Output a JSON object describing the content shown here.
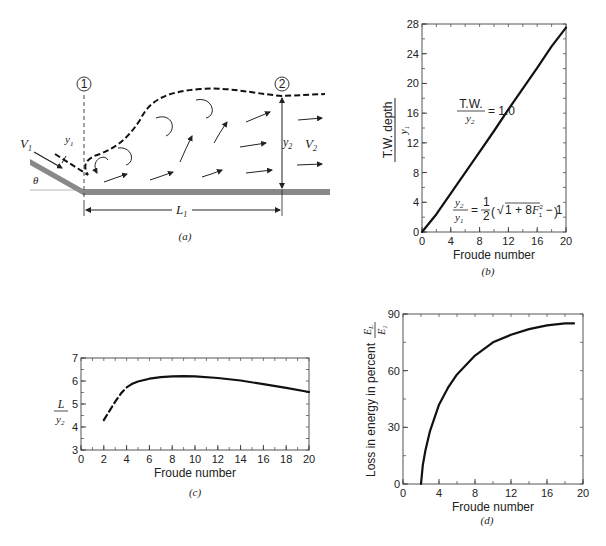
{
  "panel_a": {
    "caption": "(a)",
    "labels": {
      "section1": "1",
      "section2": "2",
      "v1": "V",
      "v1_sub": "1",
      "v2": "V",
      "v2_sub": "2",
      "y1": "y",
      "y1_sub": "1",
      "y2": "y",
      "y2_sub": "2",
      "theta": "θ",
      "l1": "L",
      "l1_sub": "1"
    }
  },
  "panel_b": {
    "caption": "(b)",
    "ylabel_num": "T.W. depth",
    "ylabel_den": "y1",
    "xlabel": "Froude number",
    "annotation_tw_num": "T.W.",
    "annotation_tw_den": "y2",
    "annotation_tw_eq": "= 1.0",
    "equation": "y2/y1 = 1/2 ( √(1 + 8F1²) − 1 )"
  },
  "panel_c": {
    "caption": "(c)",
    "ylabel_num": "L",
    "ylabel_den": "y2",
    "xlabel": "Froude number"
  },
  "panel_d": {
    "caption": "(d)",
    "ylabel": "Loss in energy in percent",
    "ylabel_frac_num": "EL",
    "ylabel_frac_den": "E1",
    "xlabel": "Froude number"
  },
  "chart_data": [
    {
      "id": "b",
      "type": "line",
      "title": "",
      "xlabel": "Froude number",
      "ylabel": "T.W. depth / y1",
      "xlim": [
        0,
        20
      ],
      "ylim": [
        0,
        28
      ],
      "xticks": [
        0,
        4,
        8,
        12,
        16,
        20
      ],
      "yticks": [
        0,
        4,
        8,
        12,
        16,
        20,
        24,
        28
      ],
      "grid": false,
      "annotations": [
        "T.W./y2 = 1.0",
        "y2/y1 = 1/2(√(1+8F1²) − 1)"
      ],
      "series": [
        {
          "name": "T.W./y2 = 1.0",
          "style": "solid",
          "x": [
            0,
            2,
            4,
            6,
            8,
            10,
            12,
            14,
            16,
            18,
            20
          ],
          "y": [
            0,
            2.4,
            5.2,
            8.0,
            10.8,
            13.6,
            16.5,
            19.3,
            22.1,
            25.0,
            27.5
          ]
        }
      ]
    },
    {
      "id": "c",
      "type": "line",
      "title": "",
      "xlabel": "Froude number",
      "ylabel": "L / y2",
      "xlim": [
        0,
        20
      ],
      "ylim": [
        3,
        7
      ],
      "xticks": [
        0,
        2,
        4,
        6,
        8,
        10,
        12,
        14,
        16,
        18,
        20
      ],
      "yticks": [
        3,
        4,
        5,
        6,
        7
      ],
      "grid": false,
      "series": [
        {
          "name": "dashed (uncertain)",
          "style": "dashed",
          "x": [
            2,
            2.5,
            3,
            3.5,
            4,
            4.5
          ],
          "y": [
            4.3,
            4.7,
            5.1,
            5.45,
            5.72,
            5.88
          ]
        },
        {
          "name": "solid",
          "style": "solid",
          "x": [
            4.5,
            5,
            6,
            7,
            8,
            9,
            10,
            12,
            14,
            16,
            18,
            20
          ],
          "y": [
            5.88,
            5.98,
            6.1,
            6.17,
            6.2,
            6.21,
            6.2,
            6.13,
            6.02,
            5.86,
            5.7,
            5.52
          ]
        }
      ]
    },
    {
      "id": "d",
      "type": "line",
      "title": "",
      "xlabel": "Froude number",
      "ylabel": "Loss in energy in percent EL/E1",
      "xlim": [
        0,
        20
      ],
      "ylim": [
        0,
        90
      ],
      "xticks": [
        0,
        4,
        8,
        12,
        16,
        20
      ],
      "yticks": [
        0,
        30,
        60,
        90
      ],
      "grid": false,
      "series": [
        {
          "name": "EL/E1",
          "style": "solid",
          "x": [
            2,
            2.2,
            2.5,
            3,
            4,
            5,
            6,
            8,
            10,
            12,
            14,
            16,
            18,
            19
          ],
          "y": [
            0,
            10,
            18,
            28,
            42,
            51,
            58,
            68,
            75,
            79,
            82,
            84,
            85,
            85
          ]
        }
      ]
    }
  ]
}
